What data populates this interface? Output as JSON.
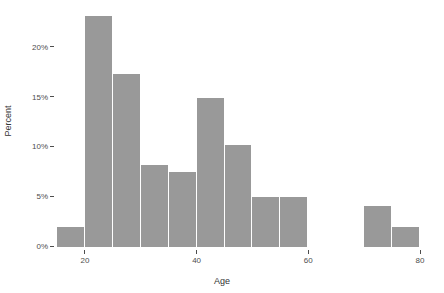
{
  "chart_data": {
    "type": "bar",
    "title": "",
    "subtitle": "",
    "xlabel": "Age",
    "ylabel": "Percent",
    "grid": false,
    "legend": "none",
    "bin_width": 5,
    "xlim": [
      15,
      80
    ],
    "ylim": [
      0,
      24
    ],
    "x_ticks": [
      20,
      40,
      60,
      80
    ],
    "x_tick_labels": [
      "20",
      "40",
      "60",
      "80"
    ],
    "y_ticks": [
      0,
      5,
      10,
      15,
      20
    ],
    "y_tick_labels": [
      "0%",
      "5%",
      "10%",
      "15%",
      "20%"
    ],
    "bar_color": "#999999",
    "background_color": "#ffffff",
    "axis_text_color": "#4d4d4d",
    "bins": [
      {
        "x0": 15,
        "x1": 20,
        "label": "15-20",
        "value": 2.0
      },
      {
        "x0": 20,
        "x1": 25,
        "label": "20-25",
        "value": 23.2
      },
      {
        "x0": 25,
        "x1": 30,
        "label": "25-30",
        "value": 17.4
      },
      {
        "x0": 30,
        "x1": 35,
        "label": "30-35",
        "value": 8.2
      },
      {
        "x0": 35,
        "x1": 40,
        "label": "35-40",
        "value": 7.5
      },
      {
        "x0": 40,
        "x1": 45,
        "label": "40-45",
        "value": 15.0
      },
      {
        "x0": 45,
        "x1": 50,
        "label": "45-50",
        "value": 10.2
      },
      {
        "x0": 50,
        "x1": 55,
        "label": "50-55",
        "value": 5.0
      },
      {
        "x0": 55,
        "x1": 60,
        "label": "55-60",
        "value": 5.0
      },
      {
        "x0": 70,
        "x1": 75,
        "label": "70-75",
        "value": 4.1
      },
      {
        "x0": 75,
        "x1": 80,
        "label": "75-80",
        "value": 2.0
      }
    ],
    "categories": [
      "15-20",
      "20-25",
      "25-30",
      "30-35",
      "35-40",
      "40-45",
      "45-50",
      "50-55",
      "55-60",
      "70-75",
      "75-80"
    ],
    "values": [
      2.0,
      23.2,
      17.4,
      8.2,
      7.5,
      15.0,
      10.2,
      5.0,
      5.0,
      4.1,
      2.0
    ]
  }
}
